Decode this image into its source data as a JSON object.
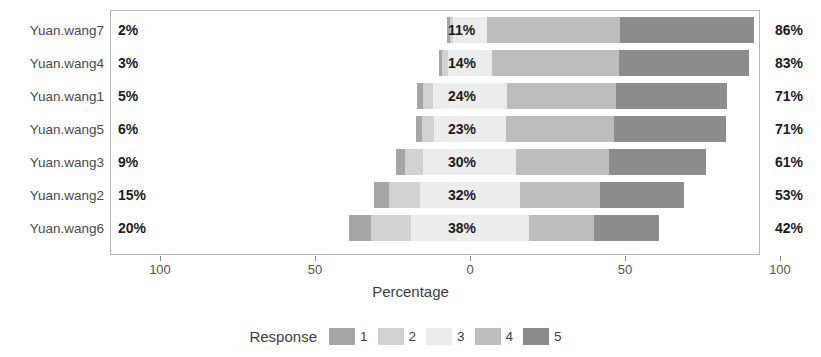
{
  "chart_data": {
    "type": "bar",
    "subtype": "diverging-stacked-likert",
    "title": "",
    "xlabel": "Percentage",
    "ylabel": "",
    "legend_title": "Response",
    "legend_position": "bottom",
    "grid": false,
    "xlim": [
      -100,
      100
    ],
    "xticks": [
      -100,
      -50,
      0,
      50,
      100
    ],
    "xtick_labels": [
      "100",
      "50",
      "0",
      "50",
      "100"
    ],
    "categories": [
      "Yuan.wang7",
      "Yuan.wang4",
      "Yuan.wang1",
      "Yuan.wang5",
      "Yuan.wang3",
      "Yuan.wang2",
      "Yuan.wang6"
    ],
    "response_levels": [
      "1",
      "2",
      "3",
      "4",
      "5"
    ],
    "colors": {
      "1": "#a6a6a6",
      "2": "#d2d2d2",
      "3": "#ececec",
      "4": "#bdbdbd",
      "5": "#8c8c8c"
    },
    "left_labels": [
      "2%",
      "3%",
      "5%",
      "6%",
      "9%",
      "15%",
      "20%"
    ],
    "center_labels": [
      "11%",
      "14%",
      "24%",
      "23%",
      "30%",
      "32%",
      "38%"
    ],
    "right_labels": [
      "86%",
      "83%",
      "71%",
      "71%",
      "61%",
      "53%",
      "42%"
    ],
    "series": [
      {
        "name": "1",
        "values": [
          1,
          1,
          2,
          2,
          3,
          5,
          7
        ]
      },
      {
        "name": "2",
        "values": [
          1,
          2,
          3,
          4,
          6,
          10,
          13
        ]
      },
      {
        "name": "3",
        "values": [
          11,
          14,
          24,
          23,
          30,
          32,
          38
        ]
      },
      {
        "name": "4",
        "values": [
          43,
          41,
          35,
          35,
          30,
          26,
          21
        ]
      },
      {
        "name": "5",
        "values": [
          43,
          42,
          36,
          36,
          31,
          27,
          21
        ]
      }
    ],
    "rows": [
      {
        "category": "Yuan.wang7",
        "negative": 2,
        "neutral": 11,
        "positive": 86,
        "segments": [
          {
            "level": "1",
            "value": 1
          },
          {
            "level": "2",
            "value": 1
          },
          {
            "level": "3",
            "value": 11
          },
          {
            "level": "4",
            "value": 43
          },
          {
            "level": "5",
            "value": 43
          }
        ]
      },
      {
        "category": "Yuan.wang4",
        "negative": 3,
        "neutral": 14,
        "positive": 83,
        "segments": [
          {
            "level": "1",
            "value": 1
          },
          {
            "level": "2",
            "value": 2
          },
          {
            "level": "3",
            "value": 14
          },
          {
            "level": "4",
            "value": 41
          },
          {
            "level": "5",
            "value": 42
          }
        ]
      },
      {
        "category": "Yuan.wang1",
        "negative": 5,
        "neutral": 24,
        "positive": 71,
        "segments": [
          {
            "level": "1",
            "value": 2
          },
          {
            "level": "2",
            "value": 3
          },
          {
            "level": "3",
            "value": 24
          },
          {
            "level": "4",
            "value": 35
          },
          {
            "level": "5",
            "value": 36
          }
        ]
      },
      {
        "category": "Yuan.wang5",
        "negative": 6,
        "neutral": 23,
        "positive": 71,
        "segments": [
          {
            "level": "1",
            "value": 2
          },
          {
            "level": "2",
            "value": 4
          },
          {
            "level": "3",
            "value": 23
          },
          {
            "level": "4",
            "value": 35
          },
          {
            "level": "5",
            "value": 36
          }
        ]
      },
      {
        "category": "Yuan.wang3",
        "negative": 9,
        "neutral": 30,
        "positive": 61,
        "segments": [
          {
            "level": "1",
            "value": 3
          },
          {
            "level": "2",
            "value": 6
          },
          {
            "level": "3",
            "value": 30
          },
          {
            "level": "4",
            "value": 30
          },
          {
            "level": "5",
            "value": 31
          }
        ]
      },
      {
        "category": "Yuan.wang2",
        "negative": 15,
        "neutral": 32,
        "positive": 53,
        "segments": [
          {
            "level": "1",
            "value": 5
          },
          {
            "level": "2",
            "value": 10
          },
          {
            "level": "3",
            "value": 32
          },
          {
            "level": "4",
            "value": 26
          },
          {
            "level": "5",
            "value": 27
          }
        ]
      },
      {
        "category": "Yuan.wang6",
        "negative": 20,
        "neutral": 38,
        "positive": 42,
        "segments": [
          {
            "level": "1",
            "value": 7
          },
          {
            "level": "2",
            "value": 13
          },
          {
            "level": "3",
            "value": 38
          },
          {
            "level": "4",
            "value": 21
          },
          {
            "level": "5",
            "value": 21
          }
        ]
      }
    ]
  }
}
